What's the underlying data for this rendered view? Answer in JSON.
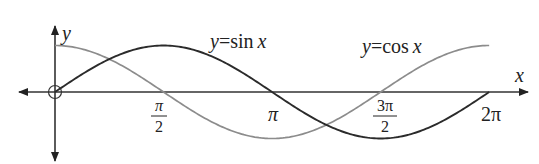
{
  "chart_data": {
    "type": "line",
    "title": "",
    "xlabel": "x",
    "ylabel": "y",
    "xlim": [
      -0.55,
      6.9
    ],
    "ylim": [
      -1.0,
      1.0
    ],
    "grid": false,
    "legend_position": "inline labels",
    "x_ticks": [
      {
        "value": 1.5708,
        "label_num": "π",
        "label_den": "2"
      },
      {
        "value": 3.1416,
        "label": "π"
      },
      {
        "value": 4.7124,
        "label_num": "3π",
        "label_den": "2"
      },
      {
        "value": 6.2832,
        "label": "2π"
      }
    ],
    "series": [
      {
        "name": "y=sin x",
        "color": "#2b2b2b",
        "function": "sin",
        "x": [
          0,
          0.7854,
          1.5708,
          2.3562,
          3.1416,
          3.927,
          4.7124,
          5.4978,
          6.2832
        ],
        "values": [
          0,
          0.707,
          1,
          0.707,
          0,
          -0.707,
          -1,
          -0.707,
          0
        ]
      },
      {
        "name": "y=cos x",
        "color": "#8c8c8c",
        "function": "cos",
        "x": [
          0,
          0.7854,
          1.5708,
          2.3562,
          3.1416,
          3.927,
          4.7124,
          5.4978,
          6.2832
        ],
        "values": [
          1,
          0.707,
          0,
          -0.707,
          -1,
          -0.707,
          0,
          0.707,
          1
        ]
      }
    ],
    "annotations": [
      {
        "text_prefix": "y",
        "text_eq": "=",
        "text_fn": "sin",
        "text_var": "x",
        "series": "y=sin x"
      },
      {
        "text_prefix": "y",
        "text_eq": "=",
        "text_fn": "cos",
        "text_var": "x",
        "series": "y=cos x"
      }
    ],
    "origin_marker": "open-circle"
  }
}
